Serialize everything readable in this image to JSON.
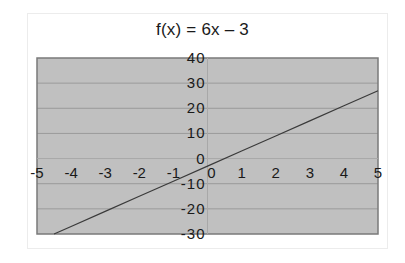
{
  "chart_data": {
    "type": "line",
    "title": "f(x) = 6x – 3",
    "function": "f(x) = 6x - 3",
    "xlabel": "",
    "ylabel": "",
    "xlim": [
      -5,
      5
    ],
    "ylim": [
      -30,
      40
    ],
    "x_ticks": [
      -5,
      -4,
      -3,
      -2,
      -1,
      0,
      1,
      2,
      3,
      4,
      5
    ],
    "y_ticks": [
      -30,
      -20,
      -10,
      0,
      10,
      20,
      30,
      40
    ],
    "x_tick_labels": [
      "-5",
      "-4",
      "-3",
      "-2",
      "-1",
      "0",
      "1",
      "2",
      "3",
      "4",
      "5"
    ],
    "y_tick_labels": [
      "-30",
      "-20",
      "-10",
      "0",
      "10",
      "20",
      "30",
      "40"
    ],
    "grid": {
      "horizontal": true,
      "vertical": false
    },
    "legend": null,
    "series": [
      {
        "name": "f(x) = 6x - 3",
        "x": [
          -4.5,
          -4,
          -3,
          -2,
          -1,
          0,
          1,
          2,
          3,
          4,
          5
        ],
        "values": [
          -30,
          -27,
          -21,
          -15,
          -9,
          -3,
          3,
          9,
          15,
          21,
          27
        ]
      }
    ],
    "colors": {
      "plot_background": "#c0c0c0",
      "plot_border": "#7a7a7a",
      "gridline": "#9a9a9a",
      "line": "#3a3a3a",
      "text": "#1a1a1a"
    }
  }
}
